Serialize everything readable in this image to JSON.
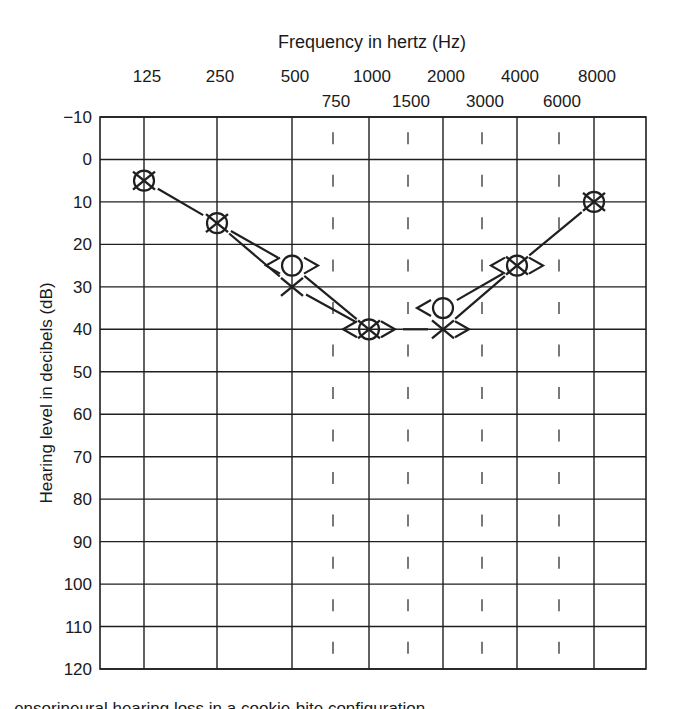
{
  "chart_data": {
    "type": "scatter",
    "subtype": "audiogram",
    "title": "Frequency in hertz (Hz)",
    "xlabel": "Frequency in hertz (Hz)",
    "ylabel": "Hearing level in decibels (dB)",
    "x_primary_ticks": [
      "125",
      "250",
      "500",
      "1000",
      "2000",
      "4000",
      "8000"
    ],
    "x_secondary_ticks": [
      "750",
      "1500",
      "3000",
      "6000"
    ],
    "y_ticks": [
      "-10",
      "0",
      "10",
      "20",
      "30",
      "40",
      "50",
      "60",
      "70",
      "80",
      "90",
      "100",
      "110",
      "120"
    ],
    "ylim": [
      -10,
      120
    ],
    "y_inverted": true,
    "grid": true,
    "series": [
      {
        "name": "Right ear air conduction",
        "marker": "O",
        "x": [
          "125",
          "250",
          "500",
          "1000",
          "2000",
          "4000",
          "8000"
        ],
        "values": [
          5,
          15,
          25,
          40,
          35,
          25,
          10
        ]
      },
      {
        "name": "Left ear air conduction",
        "marker": "X",
        "x": [
          "125",
          "250",
          "500",
          "1000",
          "2000",
          "4000",
          "8000"
        ],
        "values": [
          5,
          15,
          30,
          40,
          40,
          25,
          10
        ]
      },
      {
        "name": "Right ear bone conduction (unmasked)",
        "marker": "<",
        "x": [
          "500",
          "1000",
          "2000",
          "4000"
        ],
        "values": [
          25,
          40,
          35,
          25
        ]
      },
      {
        "name": "Left ear bone conduction (unmasked)",
        "marker": ">",
        "x": [
          "500",
          "1000",
          "2000",
          "4000"
        ],
        "values": [
          25,
          40,
          40,
          25
        ]
      }
    ]
  },
  "caption": "...ensorineural hearing loss in a cookie-bite configuration"
}
